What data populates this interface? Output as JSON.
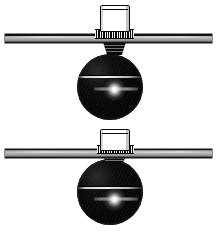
{
  "figure": {
    "background_color": "#ffffff",
    "width": 216,
    "height": 231,
    "item_count": 2
  },
  "palette": {
    "ink": "#0a0a0a",
    "sphere_black": "#050505",
    "plate_gray": "#b9b9b9",
    "plate_edge": "#111111",
    "highlight_white": "#ffffff",
    "paper_white": "#ffffff"
  },
  "assemblies": [
    {
      "id": "assembly-upper",
      "label": "Upper assembly",
      "stem_cap": {
        "label": "Cylindrical stem cap",
        "x": 99,
        "y": 5,
        "width": 30,
        "height": 27
      },
      "knurl_collar": {
        "label": "Knurled collar",
        "x": 95,
        "y": 30,
        "width": 39,
        "height": 7,
        "teeth": 17
      },
      "mount_plate": {
        "label": "Mounting plate",
        "x": 5,
        "y": 34,
        "width": 207,
        "height": 9
      },
      "neck": {
        "label": "Tapered neck",
        "x": 103,
        "y": 42,
        "width": 22,
        "height": 12
      },
      "sphere": {
        "label": "Spherical ball",
        "cx": 110,
        "cy": 87,
        "radius": 33
      },
      "equator": {
        "label": "Equator seam line",
        "y": 77
      },
      "specular": {
        "label": "Specular highlight",
        "cx": 114,
        "cy": 90,
        "radius": 11
      }
    },
    {
      "id": "assembly-lower",
      "label": "Lower assembly",
      "stem_cap": {
        "label": "Cylindrical stem cap",
        "x": 99,
        "y": 129,
        "width": 30,
        "height": 22
      },
      "knurl_collar": {
        "label": "Knurled collar",
        "x": 97,
        "y": 145,
        "width": 37,
        "height": 7,
        "teeth": 16
      },
      "mount_plate": {
        "label": "Mounting plate",
        "x": 5,
        "y": 149,
        "width": 207,
        "height": 9
      },
      "neck": {
        "label": "Tapered neck",
        "x": 103,
        "y": 157,
        "width": 22,
        "height": 4
      },
      "sphere": {
        "label": "Spherical ball",
        "cx": 110,
        "cy": 192,
        "radius": 33
      },
      "equator": {
        "label": "Equator seam line",
        "y": 188
      },
      "specular": {
        "label": "Specular highlight",
        "cx": 114,
        "cy": 197,
        "radius": 11
      }
    }
  ]
}
